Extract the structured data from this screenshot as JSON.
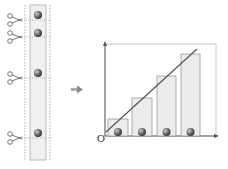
{
  "diagram": {
    "origin_label": "O",
    "arrow": "right-arrow",
    "tape": {
      "ball_y": [
        15,
        33,
        73,
        133
      ],
      "scissors_y": [
        20,
        37,
        78,
        138
      ]
    },
    "bars": [
      {
        "x": 108,
        "top": 119
      },
      {
        "x": 132,
        "top": 98
      },
      {
        "x": 157,
        "top": 76
      },
      {
        "x": 181,
        "top": 54
      }
    ],
    "fit_line": {
      "x1": 106,
      "y1": 132,
      "x2": 197,
      "y2": 49
    },
    "colors": {
      "bar_fill": "#ececec",
      "bar_stroke": "#999999",
      "line": "#555555",
      "ball": "#6a6a6a",
      "axis": "#555555"
    }
  }
}
